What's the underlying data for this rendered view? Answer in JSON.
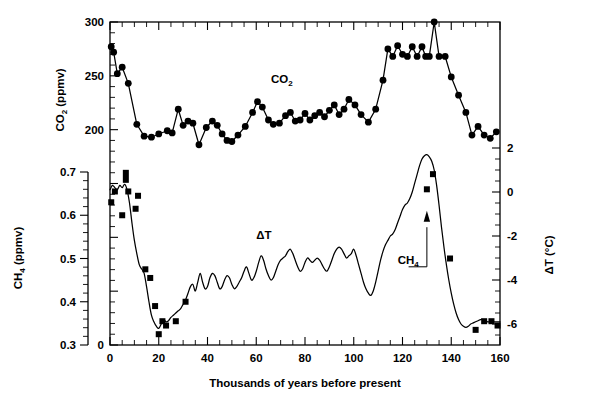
{
  "figure": {
    "title": "",
    "xlabel": "Thousands of years before present",
    "left_outer_axis_title": "CH",
    "left_outer_axis_title_sub": "4",
    "left_outer_axis_title_unit": " (ppmv)",
    "left_inner_axis_title": "CO",
    "left_inner_axis_title_sub": "2",
    "left_inner_axis_title_unit": " (ppmv)",
    "right_axis_title": "ΔT (°C)"
  },
  "labels": {
    "co2": "CO",
    "co2_sub": "2",
    "ch4": "CH",
    "ch4_sub": "4",
    "dt": "ΔT"
  },
  "axes": {
    "x": {
      "label": "Thousands of years before present",
      "min": 0,
      "max": 160,
      "ticks": [
        0,
        20,
        40,
        60,
        80,
        100,
        120,
        140,
        160
      ],
      "tick_labels": [
        "0",
        "20",
        "40",
        "60",
        "80",
        "100",
        "120",
        "140",
        "160"
      ],
      "minor_step": 5
    },
    "co2": {
      "label": "CO2 (ppmv)",
      "unit": "ppmv",
      "min": 0,
      "max": 300,
      "ticks": [
        0,
        200,
        250,
        300
      ],
      "tick_labels": [
        "0",
        "200",
        "250",
        "300"
      ],
      "minor_step": 10
    },
    "ch4": {
      "label": "CH4 (ppmv)",
      "unit": "ppmv",
      "min": 0.3,
      "max": 0.7,
      "ticks": [
        0.3,
        0.4,
        0.5,
        0.6,
        0.7
      ],
      "tick_labels": [
        "0.3",
        "0.4",
        "0.5",
        "0.6",
        "0.7"
      ],
      "minor_step": 0.02
    },
    "dt": {
      "label": "ΔT (°C)",
      "unit": "°C",
      "min": -6.5,
      "max": 2.6,
      "ticks": [
        -6,
        -4,
        -2,
        0,
        2
      ],
      "tick_labels": [
        "-6",
        "-4",
        "-2",
        "0",
        "2"
      ],
      "minor_step": 0.5
    }
  },
  "chart_data": {
    "type": "line",
    "xlabel": "Thousands of years before present",
    "ylabel": "CO2 (ppmv) / CH4 (ppmv) / ΔT (°C)",
    "xlim": [
      0,
      160
    ],
    "grid": false,
    "legend": "inline-annotations",
    "series": [
      {
        "name": "CO2",
        "marker": "filled-circle",
        "unit": "ppmv",
        "ylim": [
          0,
          300
        ],
        "axis": "left-inner",
        "points": [
          [
            0.5,
            277
          ],
          [
            1.5,
            272
          ],
          [
            3.0,
            252
          ],
          [
            5.0,
            258
          ],
          [
            7.5,
            243
          ],
          [
            11.0,
            205
          ],
          [
            14.0,
            194
          ],
          [
            17.0,
            193
          ],
          [
            20.0,
            196
          ],
          [
            23.5,
            199
          ],
          [
            25.5,
            197
          ],
          [
            28.0,
            219
          ],
          [
            30.0,
            204
          ],
          [
            32.0,
            208
          ],
          [
            34.0,
            206
          ],
          [
            36.5,
            186
          ],
          [
            39.5,
            202
          ],
          [
            42.0,
            208
          ],
          [
            44.0,
            204
          ],
          [
            46.0,
            196
          ],
          [
            48.0,
            190
          ],
          [
            50.0,
            189
          ],
          [
            52.5,
            195
          ],
          [
            55.5,
            203
          ],
          [
            58.5,
            216
          ],
          [
            60.5,
            226
          ],
          [
            62.5,
            221
          ],
          [
            65.0,
            209
          ],
          [
            67.0,
            205
          ],
          [
            69.5,
            206
          ],
          [
            72.0,
            213
          ],
          [
            74.0,
            216
          ],
          [
            76.0,
            208
          ],
          [
            78.0,
            209
          ],
          [
            80.0,
            215
          ],
          [
            82.0,
            209
          ],
          [
            84.0,
            213
          ],
          [
            86.0,
            216
          ],
          [
            88.0,
            212
          ],
          [
            90.0,
            218
          ],
          [
            92.0,
            223
          ],
          [
            94.0,
            214
          ],
          [
            96.0,
            219
          ],
          [
            98.0,
            228
          ],
          [
            100.5,
            223
          ],
          [
            103.0,
            214
          ],
          [
            106.0,
            207
          ],
          [
            109.0,
            219
          ],
          [
            112.0,
            246
          ],
          [
            114.0,
            275
          ],
          [
            116.0,
            268
          ],
          [
            118.0,
            278
          ],
          [
            120.0,
            270
          ],
          [
            122.0,
            268
          ],
          [
            124.0,
            277
          ],
          [
            126.0,
            268
          ],
          [
            128.0,
            277
          ],
          [
            129.5,
            268
          ],
          [
            131.0,
            268
          ],
          [
            133.0,
            300
          ],
          [
            135.0,
            268
          ],
          [
            137.5,
            268
          ],
          [
            140.0,
            249
          ],
          [
            143.0,
            232
          ],
          [
            146.0,
            216
          ],
          [
            148.5,
            195
          ],
          [
            151.0,
            203
          ],
          [
            153.5,
            195
          ],
          [
            156.0,
            192
          ],
          [
            158.5,
            198
          ]
        ]
      },
      {
        "name": "CH4",
        "marker": "filled-square",
        "unit": "ppmv",
        "ylim": [
          0.3,
          0.7
        ],
        "axis": "left-outer",
        "points": [
          [
            0.5,
            0.63
          ],
          [
            2.0,
            0.655
          ],
          [
            5.0,
            0.6
          ],
          [
            6.5,
            0.69
          ],
          [
            7.5,
            0.655
          ],
          [
            10.5,
            0.615
          ],
          [
            11.5,
            0.645
          ],
          [
            14.5,
            0.475
          ],
          [
            16.5,
            0.455
          ],
          [
            18.5,
            0.39
          ],
          [
            20.0,
            0.325
          ],
          [
            21.5,
            0.355
          ],
          [
            23.0,
            0.345
          ],
          [
            27.0,
            0.355
          ],
          [
            31.0,
            0.4
          ],
          [
            130.0,
            0.66
          ],
          [
            132.5,
            0.695
          ],
          [
            139.5,
            0.5
          ],
          [
            150.0,
            0.335
          ],
          [
            153.5,
            0.355
          ],
          [
            156.5,
            0.355
          ],
          [
            159.0,
            0.345
          ]
        ]
      },
      {
        "name": "ΔT",
        "marker": "none",
        "unit": "°C",
        "ylim": [
          -6.5,
          2.6
        ],
        "axis": "right",
        "points": [
          [
            0,
            0.1
          ],
          [
            1,
            0.3
          ],
          [
            2,
            0.2
          ],
          [
            3,
            0.1
          ],
          [
            4,
            0.3
          ],
          [
            5,
            0.2
          ],
          [
            6,
            0.35
          ],
          [
            7,
            0.1
          ],
          [
            8,
            -0.5
          ],
          [
            9,
            -1.4
          ],
          [
            10,
            -2.2
          ],
          [
            11,
            -2.8
          ],
          [
            12,
            -3.3
          ],
          [
            13,
            -3.5
          ],
          [
            14,
            -3.7
          ],
          [
            15,
            -4.3
          ],
          [
            16,
            -5.0
          ],
          [
            17,
            -5.6
          ],
          [
            18,
            -5.9
          ],
          [
            19,
            -6.1
          ],
          [
            20,
            -6.2
          ],
          [
            21,
            -6.0
          ],
          [
            22,
            -5.8
          ],
          [
            23,
            -5.9
          ],
          [
            24,
            -5.85
          ],
          [
            25,
            -5.7
          ],
          [
            26,
            -5.6
          ],
          [
            27,
            -5.5
          ],
          [
            28,
            -5.4
          ],
          [
            29,
            -5.3
          ],
          [
            30,
            -5.1
          ],
          [
            31,
            -4.9
          ],
          [
            32,
            -4.6
          ],
          [
            33,
            -4.3
          ],
          [
            34,
            -4.2
          ],
          [
            35,
            -4.5
          ],
          [
            36,
            -4.1
          ],
          [
            37,
            -3.7
          ],
          [
            38,
            -4.1
          ],
          [
            39,
            -4.4
          ],
          [
            40,
            -4.3
          ],
          [
            41,
            -3.9
          ],
          [
            42,
            -3.7
          ],
          [
            43,
            -3.8
          ],
          [
            44,
            -4.1
          ],
          [
            45,
            -4.4
          ],
          [
            46,
            -4.3
          ],
          [
            47,
            -4.0
          ],
          [
            48,
            -3.8
          ],
          [
            49,
            -3.9
          ],
          [
            50,
            -4.2
          ],
          [
            51,
            -4.4
          ],
          [
            52,
            -4.3
          ],
          [
            53,
            -4.1
          ],
          [
            54,
            -3.9
          ],
          [
            55,
            -3.6
          ],
          [
            56,
            -3.4
          ],
          [
            57,
            -3.7
          ],
          [
            58,
            -4.0
          ],
          [
            59,
            -3.9
          ],
          [
            60,
            -3.6
          ],
          [
            61,
            -3.2
          ],
          [
            62,
            -2.9
          ],
          [
            63,
            -3.1
          ],
          [
            64,
            -3.5
          ],
          [
            65,
            -3.8
          ],
          [
            66,
            -4.0
          ],
          [
            67,
            -3.9
          ],
          [
            68,
            -3.6
          ],
          [
            69,
            -3.3
          ],
          [
            70,
            -3.1
          ],
          [
            71,
            -3.0
          ],
          [
            72,
            -2.9
          ],
          [
            73,
            -2.7
          ],
          [
            74,
            -2.6
          ],
          [
            75,
            -2.8
          ],
          [
            76,
            -3.1
          ],
          [
            77,
            -3.4
          ],
          [
            78,
            -3.6
          ],
          [
            79,
            -3.5
          ],
          [
            80,
            -3.2
          ],
          [
            81,
            -3.0
          ],
          [
            82,
            -3.1
          ],
          [
            83,
            -3.2
          ],
          [
            84,
            -3.1
          ],
          [
            85,
            -3.0
          ],
          [
            86,
            -3.1
          ],
          [
            87,
            -3.3
          ],
          [
            88,
            -3.5
          ],
          [
            89,
            -3.6
          ],
          [
            90,
            -3.4
          ],
          [
            91,
            -3.1
          ],
          [
            92,
            -2.8
          ],
          [
            93,
            -2.6
          ],
          [
            94,
            -2.5
          ],
          [
            95,
            -2.6
          ],
          [
            96,
            -2.8
          ],
          [
            97,
            -3.0
          ],
          [
            98,
            -2.9
          ],
          [
            99,
            -2.8
          ],
          [
            100,
            -2.6
          ],
          [
            101,
            -2.9
          ],
          [
            102,
            -3.3
          ],
          [
            103,
            -3.7
          ],
          [
            104,
            -4.1
          ],
          [
            105,
            -4.4
          ],
          [
            106,
            -4.6
          ],
          [
            107,
            -4.7
          ],
          [
            108,
            -4.5
          ],
          [
            109,
            -4.1
          ],
          [
            110,
            -3.6
          ],
          [
            111,
            -3.1
          ],
          [
            112,
            -2.7
          ],
          [
            113,
            -2.4
          ],
          [
            114,
            -2.2
          ],
          [
            115,
            -2.0
          ],
          [
            116,
            -1.9
          ],
          [
            117,
            -1.7
          ],
          [
            118,
            -1.4
          ],
          [
            119,
            -1.1
          ],
          [
            120,
            -0.8
          ],
          [
            121,
            -0.6
          ],
          [
            122,
            -0.5
          ],
          [
            123,
            -0.3
          ],
          [
            124,
            0.0
          ],
          [
            125,
            0.4
          ],
          [
            126,
            0.8
          ],
          [
            127,
            1.2
          ],
          [
            128,
            1.5
          ],
          [
            129,
            1.65
          ],
          [
            130,
            1.7
          ],
          [
            131,
            1.6
          ],
          [
            132,
            1.4
          ],
          [
            133,
            1.0
          ],
          [
            134,
            0.3
          ],
          [
            135,
            -0.6
          ],
          [
            136,
            -1.6
          ],
          [
            137,
            -2.5
          ],
          [
            138,
            -3.3
          ],
          [
            139,
            -4.0
          ],
          [
            140,
            -4.6
          ],
          [
            141,
            -5.1
          ],
          [
            142,
            -5.5
          ],
          [
            143,
            -5.8
          ],
          [
            144,
            -6.0
          ],
          [
            145,
            -6.1
          ],
          [
            146,
            -6.15
          ],
          [
            147,
            -6.1
          ],
          [
            148,
            -6.0
          ],
          [
            149,
            -5.95
          ],
          [
            150,
            -5.9
          ],
          [
            151,
            -5.85
          ],
          [
            152,
            -5.8
          ],
          [
            153,
            -5.8
          ],
          [
            154,
            -5.85
          ],
          [
            155,
            -5.9
          ],
          [
            156,
            -5.9
          ],
          [
            157,
            -5.9
          ],
          [
            158,
            -5.9
          ],
          [
            159,
            -5.9
          ],
          [
            160,
            -5.9
          ]
        ]
      }
    ],
    "annotations": [
      {
        "text": "CO2",
        "x": 68,
        "unit": "ppmv"
      },
      {
        "text": "CH4",
        "x": 126,
        "unit": "ppmv"
      },
      {
        "text": "ΔT",
        "x": 63,
        "unit": "°C"
      }
    ]
  }
}
